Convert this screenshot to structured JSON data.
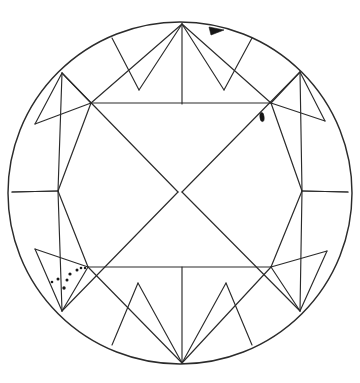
{
  "diagram": {
    "view": "crown",
    "shape": "round-brilliant",
    "background_color": "#ffffff",
    "line_color": "#2b2b2b",
    "inclusion_color": "#161616",
    "canvas": {
      "width": 360,
      "height": 383
    },
    "girdle": {
      "name": "girdle-outline",
      "center_x": 180,
      "center_y": 193,
      "radius_x": 172,
      "radius_y": 171,
      "stroke_width": 1.45
    },
    "table": {
      "name": "table-octagon",
      "sides": 8,
      "vertices": [
        [
          91,
          103
        ],
        [
          271,
          103
        ],
        [
          302,
          191
        ],
        [
          271,
          267
        ],
        [
          270,
          267
        ],
        [
          88,
          267
        ],
        [
          58,
          191
        ],
        [
          90,
          104
        ]
      ]
    },
    "facet_counts": {
      "bezel_facets": 8,
      "star_facets": 8,
      "upper_girdle_facets": 16,
      "table_facets": 1
    },
    "star_points": [
      [
        182,
        24
      ],
      [
        300,
        72
      ],
      [
        348,
        192
      ],
      [
        300,
        311
      ],
      [
        182,
        363
      ],
      [
        62,
        311
      ],
      [
        12,
        192
      ],
      [
        62,
        73
      ]
    ]
  },
  "inclusions": [
    {
      "id": "natural-top-girdle",
      "type": "natural",
      "symbol": "filled-triangle",
      "position": {
        "x": 216,
        "y": 30
      },
      "size": {
        "width": 15,
        "height": 8
      },
      "rotation_deg": -8,
      "location": "top girdle"
    },
    {
      "id": "crystal-upper-right",
      "type": "crystal",
      "symbol": "filled-oval",
      "position": {
        "x": 262,
        "y": 117
      },
      "size": {
        "width": 4,
        "height": 9
      },
      "rotation_deg": -6,
      "location": "upper right bezel facet"
    },
    {
      "id": "pinpoint-cluster-lower-left",
      "type": "pinpoint-cluster",
      "symbol": "dot-group",
      "location": "lower left upper-girdle facet",
      "count": 8,
      "dots": [
        {
          "x": 77,
          "y": 270,
          "r": 1.5
        },
        {
          "x": 81,
          "y": 268,
          "r": 1.3
        },
        {
          "x": 85,
          "y": 268,
          "r": 1.2
        },
        {
          "x": 70,
          "y": 274,
          "r": 1.6
        },
        {
          "x": 58,
          "y": 279,
          "r": 1.5
        },
        {
          "x": 67,
          "y": 280,
          "r": 1.5
        },
        {
          "x": 52,
          "y": 282,
          "r": 1.3
        },
        {
          "x": 64,
          "y": 288,
          "r": 1.7
        }
      ]
    }
  ],
  "legend": {
    "visible": false,
    "entries": []
  }
}
